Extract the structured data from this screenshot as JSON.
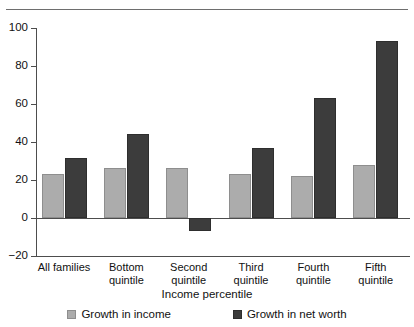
{
  "chart_data": {
    "type": "bar",
    "title": "",
    "subtitle": "",
    "xlabel": "Income percentile",
    "ylabel": "",
    "ylim": [
      -20,
      100
    ],
    "yticks": [
      -20,
      0,
      20,
      40,
      60,
      80,
      100
    ],
    "ytick_labels": [
      "−20",
      "0",
      "20",
      "40",
      "60",
      "80",
      "100"
    ],
    "grid": false,
    "legend_position": "bottom",
    "categories": [
      "All families",
      "Bottom\nquintile",
      "Second\nquintile",
      "Third\nquintile",
      "Fourth\nquintile",
      "Fifth\nquintile"
    ],
    "series": [
      {
        "name": "Growth in income",
        "color": "#acacac",
        "values": [
          23,
          26.5,
          26.5,
          23,
          22,
          28
        ]
      },
      {
        "name": "Growth in net worth",
        "color": "#3c3c3c",
        "values": [
          31.5,
          44,
          -7,
          37,
          63,
          93
        ]
      }
    ]
  },
  "legend": {
    "items": [
      {
        "label": "Growth in income",
        "swatch": "light-gray-swatch"
      },
      {
        "label": "Growth in net worth",
        "swatch": "dark-gray-swatch"
      }
    ]
  },
  "colors": {
    "income_bar": "#acacac",
    "networth_bar": "#3c3c3c",
    "axis": "#4d4d4d",
    "rule": "#6e6e6e",
    "background": "#ffffff"
  }
}
